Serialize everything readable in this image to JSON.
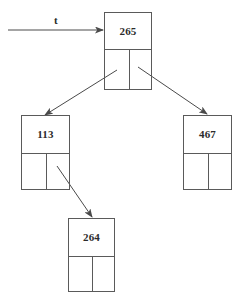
{
  "diagram": {
    "background_color": "#ffffff",
    "stroke_color": "#5a5a5a",
    "text_color": "#2b2b2b",
    "width": 248,
    "height": 304,
    "pointer": {
      "label": "t",
      "label_x": 54,
      "label_y": 15,
      "line_x1": 8,
      "line_y1": 30,
      "line_x2": 103,
      "line_y2": 30
    },
    "nodes": [
      {
        "id": "root",
        "key": "265",
        "x": 104,
        "y": 12,
        "width": 48,
        "height": 78,
        "key_area_height": 36,
        "split_x": 24
      },
      {
        "id": "left-child",
        "key": "113",
        "x": 21,
        "y": 115,
        "width": 49,
        "height": 75,
        "key_area_height": 37,
        "split_x": 24
      },
      {
        "id": "right-child",
        "key": "467",
        "x": 183,
        "y": 115,
        "width": 49,
        "height": 75,
        "key_area_height": 37,
        "split_x": 24
      },
      {
        "id": "leaf",
        "key": "264",
        "x": 68,
        "y": 218,
        "width": 47,
        "height": 74,
        "key_area_height": 37,
        "split_x": 23
      }
    ],
    "edges": [
      {
        "id": "root-to-left",
        "from": "root",
        "to": "left-child",
        "x1": 117,
        "y1": 70,
        "x2": 45,
        "y2": 115
      },
      {
        "id": "root-to-right",
        "from": "root",
        "to": "right-child",
        "x1": 138,
        "y1": 67,
        "x2": 207,
        "y2": 114
      },
      {
        "id": "left-to-leaf",
        "from": "left-child",
        "to": "leaf",
        "x1": 57,
        "y1": 166,
        "x2": 92,
        "y2": 217
      }
    ]
  }
}
